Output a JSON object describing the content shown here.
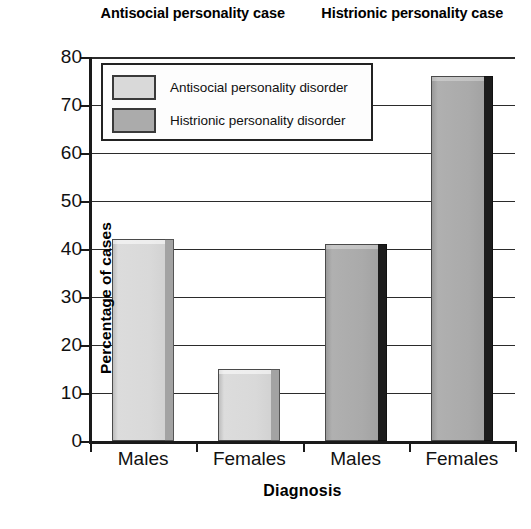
{
  "chart_data": {
    "type": "bar",
    "title": "",
    "xlabel": "Diagnosis",
    "ylabel": "Percentage of cases",
    "ylim": [
      0,
      80
    ],
    "yticks": [
      0,
      10,
      20,
      30,
      40,
      50,
      60,
      70,
      80
    ],
    "categories": [
      "Males",
      "Females",
      "Males",
      "Females"
    ],
    "group_headers": [
      "Antisocial personality case",
      "Histrionic personality case"
    ],
    "grid": true,
    "legend_position": "upper-left-inside",
    "series": [
      {
        "name": "Antisocial personality disorder",
        "color": "#d9d9d9",
        "values": [
          42,
          15,
          null,
          null
        ]
      },
      {
        "name": "Histrionic personality disorder",
        "color": "#ababab",
        "values": [
          null,
          null,
          41,
          76
        ]
      }
    ],
    "bars": [
      {
        "category": "Males",
        "group": "Antisocial personality case",
        "series": "Antisocial personality disorder",
        "value": 42,
        "style": "light"
      },
      {
        "category": "Females",
        "group": "Antisocial personality case",
        "series": "Antisocial personality disorder",
        "value": 15,
        "style": "light"
      },
      {
        "category": "Males",
        "group": "Histrionic personality case",
        "series": "Histrionic personality disorder",
        "value": 41,
        "style": "dark"
      },
      {
        "category": "Females",
        "group": "Histrionic personality case",
        "series": "Histrionic personality disorder",
        "value": 76,
        "style": "dark"
      }
    ]
  },
  "legend": {
    "items": [
      {
        "label": "Antisocial personality disorder",
        "style": "light"
      },
      {
        "label": "Histrionic personality disorder",
        "style": "dark"
      }
    ]
  },
  "axis": {
    "y_title": "Percentage of cases",
    "x_title": "Diagnosis",
    "y_ticks": [
      "80",
      "70",
      "60",
      "50",
      "40",
      "30",
      "20",
      "10",
      "0"
    ],
    "x_ticks": [
      "Males",
      "Females",
      "Males",
      "Females"
    ]
  },
  "headers": {
    "group1": "Antisocial personality case",
    "group2": "Histrionic personality case"
  }
}
